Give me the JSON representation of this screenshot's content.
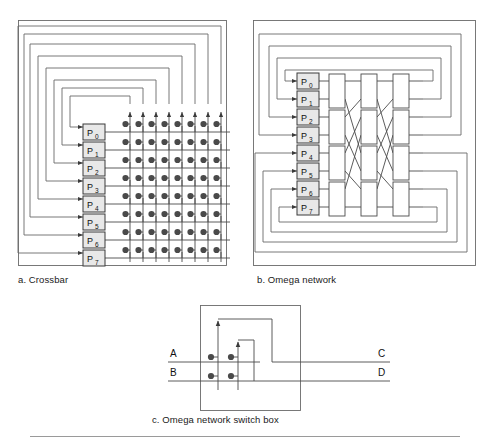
{
  "figure": {
    "panels": [
      {
        "id": "a",
        "caption": "a. Crossbar"
      },
      {
        "id": "b",
        "caption": "b. Omega network"
      },
      {
        "id": "c",
        "caption": "c. Omega network switch box"
      }
    ]
  },
  "processors": {
    "labels": [
      "P",
      "P",
      "P",
      "P",
      "P",
      "P",
      "P",
      "P"
    ],
    "subscripts": [
      "0",
      "1",
      "2",
      "3",
      "4",
      "5",
      "6",
      "7"
    ],
    "count": 8
  },
  "crossbar": {
    "rows": 8,
    "columns": 8,
    "crosspoints": 64,
    "description": "8 by 8 crossbar with a switch dot at every row-column intersection",
    "loopback_count": 8
  },
  "omega": {
    "stages": 3,
    "switches_per_stage": 4,
    "total_switches": 12,
    "inputs": 8,
    "outputs": 8,
    "pattern": "perfect shuffle",
    "loopback_count": 8
  },
  "switchbox": {
    "inputs": [
      "A",
      "B"
    ],
    "outputs": [
      "C",
      "D"
    ],
    "crosspoints": 4
  },
  "colors": {
    "line": "#4a4a4a",
    "frame": "#6a6a6a",
    "box_fill": "#e8e8e8",
    "text": "#111111",
    "rule": "#9a9a9a"
  }
}
